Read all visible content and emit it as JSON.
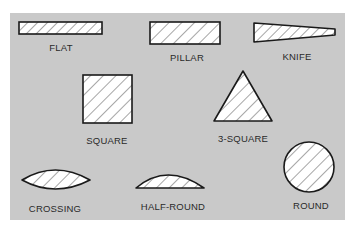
{
  "diagram": {
    "colors": {
      "panel": "#c9c9c9",
      "shape_fill": "#ffffff",
      "outline": "#1a1a1a",
      "hatch": "#3a3a3a",
      "text": "#2a2a2a"
    },
    "shapes": [
      {
        "id": "flat",
        "label": "FLAT"
      },
      {
        "id": "pillar",
        "label": "PILLAR"
      },
      {
        "id": "knife",
        "label": "KNIFE"
      },
      {
        "id": "square",
        "label": "SQUARE"
      },
      {
        "id": "three-square",
        "label": "3-SQUARE"
      },
      {
        "id": "crossing",
        "label": "CROSSING"
      },
      {
        "id": "half-round",
        "label": "HALF-ROUND"
      },
      {
        "id": "round",
        "label": "ROUND"
      }
    ]
  }
}
